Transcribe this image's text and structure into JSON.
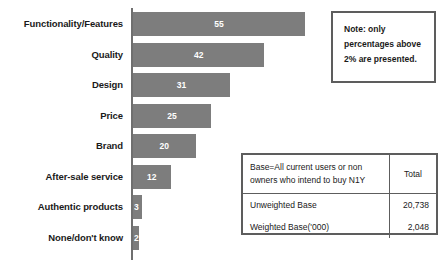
{
  "chart_data": {
    "type": "bar",
    "orientation": "horizontal",
    "title": "",
    "xlabel": "",
    "ylabel": "",
    "categories": [
      "Functionality/Features",
      "Quality",
      "Design",
      "Price",
      "Brand",
      "After-sale service",
      "Authentic products",
      "None/don't know"
    ],
    "values": [
      55,
      42,
      31,
      25,
      20,
      12,
      3,
      2
    ],
    "value_labels": [
      "55",
      "42",
      "31",
      "25",
      "20",
      "12",
      "3",
      "2"
    ],
    "xlim": [
      0,
      55
    ],
    "grid": false,
    "legend": false,
    "bar_color": "#7d7d7d",
    "value_label_color": "#ffffff",
    "axis_color": "#6f6f6f"
  },
  "note": {
    "lines": [
      "Note: only",
      "percentages above",
      "2% are presented."
    ]
  },
  "base_table": {
    "header_description": [
      "Base=All current users or non",
      "owners who intend to buy N1Y"
    ],
    "header_total": "Total",
    "rows": [
      {
        "label": "Unweighted Base",
        "value": "20,738"
      },
      {
        "label": "Weighted Base('000)",
        "value": "2,048"
      }
    ]
  }
}
